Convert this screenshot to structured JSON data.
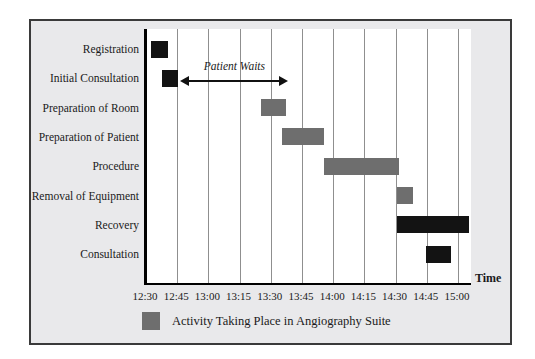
{
  "frame": {
    "background": "#e9e9eb",
    "border_color": "#3a3a3a"
  },
  "chart_data": {
    "type": "gantt",
    "title": "",
    "xlabel": "Time",
    "axis_range": [
      "12:30",
      "15:00"
    ],
    "grid": true,
    "x_ticks": [
      {
        "label": "12:30",
        "minutes": 0
      },
      {
        "label": "12:45",
        "minutes": 15
      },
      {
        "label": "13:00",
        "minutes": 30
      },
      {
        "label": "13:15",
        "minutes": 45
      },
      {
        "label": "13:30",
        "minutes": 60
      },
      {
        "label": "13:45",
        "minutes": 75
      },
      {
        "label": "14:00",
        "minutes": 90
      },
      {
        "label": "14:15",
        "minutes": 105
      },
      {
        "label": "14:30",
        "minutes": 120
      },
      {
        "label": "14:45",
        "minutes": 135
      },
      {
        "label": "15:00",
        "minutes": 150
      }
    ],
    "rows": [
      {
        "label": "Registration",
        "start": "12:32",
        "end": "12:40",
        "start_min": 2,
        "end_min": 10,
        "color": "black"
      },
      {
        "label": "Initial Consultation",
        "start": "12:37",
        "end": "12:45",
        "start_min": 7,
        "end_min": 15,
        "color": "black"
      },
      {
        "label": "Preparation of Room",
        "start": "13:25",
        "end": "13:37",
        "start_min": 55,
        "end_min": 67,
        "color": "gray"
      },
      {
        "label": "Preparation of Patient",
        "start": "13:35",
        "end": "13:55",
        "start_min": 65,
        "end_min": 85,
        "color": "gray"
      },
      {
        "label": "Procedure",
        "start": "13:55",
        "end": "14:31",
        "start_min": 85,
        "end_min": 121,
        "color": "gray"
      },
      {
        "label": "Removal of Equipment",
        "start": "14:30",
        "end": "14:38",
        "start_min": 120,
        "end_min": 128,
        "color": "gray"
      },
      {
        "label": "Recovery",
        "start": "14:30",
        "end": "15:05",
        "start_min": 120,
        "end_min": 155,
        "color": "black"
      },
      {
        "label": "Consultation",
        "start": "14:44",
        "end": "14:56",
        "start_min": 134,
        "end_min": 146,
        "color": "black"
      }
    ],
    "annotation": {
      "text": "Patient Waits",
      "row_index": 1,
      "start_min": 16,
      "end_min": 68
    },
    "legend": [
      {
        "color": "gray",
        "label": "Activity Taking Place in Angiography Suite"
      }
    ],
    "colors": {
      "black": "#131313",
      "gray": "#6e6e6e",
      "gridline": "#8f8f8f",
      "axis": "#000000"
    }
  }
}
